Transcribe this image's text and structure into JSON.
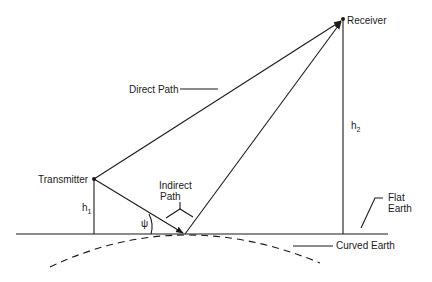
{
  "diagram": {
    "type": "two-ray ground reflection geometry",
    "labels": {
      "receiver": "Receiver",
      "transmitter": "Transmitter",
      "direct_path": "Direct Path",
      "indirect_path_line1": "Indirect",
      "indirect_path_line2": "Path",
      "h1_base": "h",
      "h1_sub": "1",
      "h2_base": "h",
      "h2_sub": "2",
      "grazing_angle": "ψ",
      "flat_earth_line1": "Flat",
      "flat_earth_line2": "Earth",
      "curved_earth": "Curved Earth"
    },
    "points": {
      "transmitter": [
        94,
        179
      ],
      "receiver": [
        343,
        19
      ],
      "reflection": [
        185,
        234
      ],
      "transmitter_ground": [
        94,
        234
      ],
      "receiver_ground": [
        343,
        234
      ]
    },
    "colors": {
      "line": "#1a1a1a",
      "background": "#ffffff"
    }
  }
}
